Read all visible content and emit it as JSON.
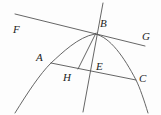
{
  "figure": {
    "type": "geometry-diagram",
    "width": 161,
    "height": 115,
    "background_color": "#fdfdfd",
    "stroke_color": "#555555",
    "label_color": "#222222",
    "point_labels": [
      "F",
      "B",
      "G",
      "A",
      "H",
      "E",
      "C"
    ],
    "labels": [
      {
        "text": "F",
        "x": 13,
        "y": 33
      },
      {
        "text": "B",
        "x": 100,
        "y": 27
      },
      {
        "text": "G",
        "x": 142,
        "y": 40
      },
      {
        "text": "A",
        "x": 36,
        "y": 61
      },
      {
        "text": "H",
        "x": 63,
        "y": 81
      },
      {
        "text": "E",
        "x": 96,
        "y": 70
      },
      {
        "text": "C",
        "x": 139,
        "y": 82
      }
    ],
    "segments": [
      {
        "name": "line-FG",
        "x1": 15,
        "y1": 14,
        "x2": 145,
        "y2": 46
      },
      {
        "name": "line-axis",
        "x1": 103,
        "y1": 3,
        "x2": 83,
        "y2": 112
      },
      {
        "name": "segment-AC",
        "x1": 51,
        "y1": 63,
        "x2": 136,
        "y2": 80
      },
      {
        "name": "segment-BH",
        "x1": 96,
        "y1": 33,
        "x2": 78,
        "y2": 69
      }
    ],
    "curve": {
      "name": "parabola",
      "path": "M 15 113 C 28 92 40 74 51 63 C 62 53 78 37 95 34 C 110 37 124 57 136 80 C 140 88 144 100 148 113"
    }
  }
}
